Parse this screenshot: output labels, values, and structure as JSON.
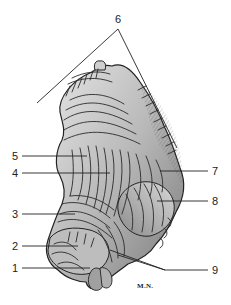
{
  "figure": {
    "signature": "M.N.",
    "colors": {
      "ink": "#222222",
      "shade_dark": "#6e6e6e",
      "shade_mid": "#a8a8a8",
      "shade_light": "#d9d9d9",
      "background": "#ffffff"
    }
  },
  "labels": [
    {
      "id": "1",
      "text": "1",
      "x": 12,
      "y": 263,
      "line_to": [
        90,
        268
      ]
    },
    {
      "id": "2",
      "text": "2",
      "x": 12,
      "y": 241,
      "line_to": [
        78,
        246
      ]
    },
    {
      "id": "3",
      "text": "3",
      "x": 12,
      "y": 209,
      "line_to": [
        75,
        214
      ]
    },
    {
      "id": "4",
      "text": "4",
      "x": 12,
      "y": 168,
      "line_to": [
        110,
        173
      ]
    },
    {
      "id": "5",
      "text": "5",
      "x": 12,
      "y": 151,
      "line_to": [
        87,
        156
      ]
    },
    {
      "id": "6",
      "text": "6",
      "x": 115,
      "y": 14,
      "apex": [
        118,
        29
      ],
      "line_left_to": [
        37,
        103
      ],
      "line_right_to": [
        177,
        148
      ]
    },
    {
      "id": "7",
      "text": "7",
      "x": 212,
      "y": 166,
      "line_to": [
        160,
        171
      ]
    },
    {
      "id": "8",
      "text": "8",
      "x": 212,
      "y": 196,
      "line_to": [
        157,
        201
      ]
    },
    {
      "id": "9",
      "text": "9",
      "x": 212,
      "y": 265,
      "line_to": [
        165,
        270
      ],
      "branches": [
        [
          118,
          255
        ],
        [
          110,
          250
        ]
      ]
    }
  ]
}
